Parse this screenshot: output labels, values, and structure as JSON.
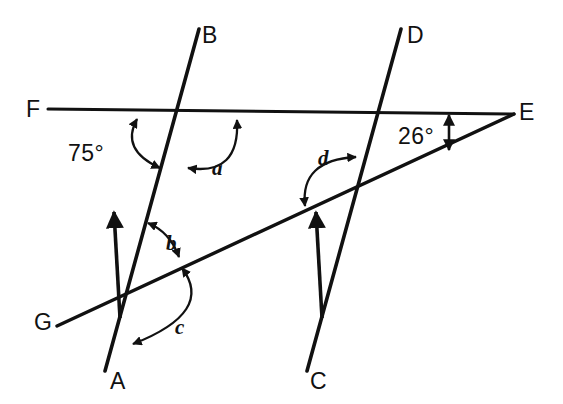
{
  "figure": {
    "background_color": "#ffffff",
    "stroke_color": "#111111",
    "width": 563,
    "height": 404
  },
  "point_labels": [
    {
      "id": "B",
      "text": "B",
      "x": 202,
      "y": 24
    },
    {
      "id": "D",
      "text": "D",
      "x": 407,
      "y": 24
    },
    {
      "id": "F",
      "text": "F",
      "x": 26,
      "y": 98
    },
    {
      "id": "E",
      "text": "E",
      "x": 519,
      "y": 101
    },
    {
      "id": "G",
      "text": "G",
      "x": 34,
      "y": 311
    },
    {
      "id": "A",
      "text": "A",
      "x": 110,
      "y": 370
    },
    {
      "id": "C",
      "text": "C",
      "x": 310,
      "y": 370
    }
  ],
  "angle_labels": [
    {
      "id": "angle-75",
      "text": "75°",
      "x": 68,
      "y": 142,
      "kind": "degree"
    },
    {
      "id": "angle-26",
      "text": "26°",
      "x": 398,
      "y": 125,
      "kind": "degree"
    },
    {
      "id": "angle-a",
      "text": "a",
      "x": 212,
      "y": 158,
      "kind": "variable"
    },
    {
      "id": "angle-b",
      "text": "b",
      "x": 166,
      "y": 233,
      "kind": "variable"
    },
    {
      "id": "angle-c",
      "text": "c",
      "x": 175,
      "y": 317,
      "kind": "variable"
    },
    {
      "id": "angle-d",
      "text": "d",
      "x": 318,
      "y": 148,
      "kind": "variable"
    }
  ],
  "lines": [
    {
      "id": "line-AB",
      "from": "A",
      "to": "B",
      "description": "transversal from A up to B, arrowhead pointing up at midsection"
    },
    {
      "id": "line-CD",
      "from": "C",
      "to": "D",
      "description": "transversal from C up to D, parallel to AB, arrowhead pointing up"
    },
    {
      "id": "line-FE",
      "from": "F",
      "to": "E",
      "description": "horizontal line from F to vertex E"
    },
    {
      "id": "line-GE",
      "from": "G",
      "to": "E",
      "description": "slanted line from G rising to vertex E"
    }
  ],
  "arcs": [
    {
      "id": "arc-75",
      "angle": "75°",
      "between": [
        "line-FE",
        "line-AB"
      ],
      "double_headed": true
    },
    {
      "id": "arc-a",
      "angle": "a",
      "between": [
        "line-AB",
        "line-FE"
      ],
      "double_headed": true
    },
    {
      "id": "arc-b",
      "angle": "b",
      "between": [
        "line-AB",
        "line-GE"
      ],
      "double_headed": true
    },
    {
      "id": "arc-c",
      "angle": "c",
      "between": [
        "line-GE",
        "line-AB"
      ],
      "double_headed": true
    },
    {
      "id": "arc-d",
      "angle": "d",
      "between": [
        "line-GE",
        "line-CD"
      ],
      "double_headed": true
    },
    {
      "id": "arc-26",
      "angle": "26°",
      "between": [
        "line-FE",
        "line-GE"
      ],
      "double_headed": true,
      "style": "vertical-double-arrow"
    }
  ]
}
